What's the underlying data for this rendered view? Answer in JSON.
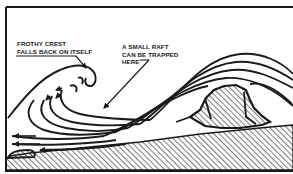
{
  "diagram": {
    "type": "cross-section",
    "colors": {
      "ink": "#1a1a1a",
      "background": "#ffffff",
      "hatch": "#333333"
    },
    "annotations": [
      {
        "id": "crest",
        "lines": [
          "FROTHY CREST",
          "FALLS BACK ON ITSELF"
        ],
        "points_to": "curling wave crest"
      },
      {
        "id": "raft",
        "lines": [
          "A SMALL RAFT",
          "CAN BE TRAPPED",
          "HERE"
        ],
        "points_to": "trough behind wave crest"
      }
    ],
    "elements": [
      "border-frame",
      "curling-wave-crest",
      "flow-streamlines-with-arrows",
      "submerged-rock",
      "hatched-seabed"
    ]
  }
}
